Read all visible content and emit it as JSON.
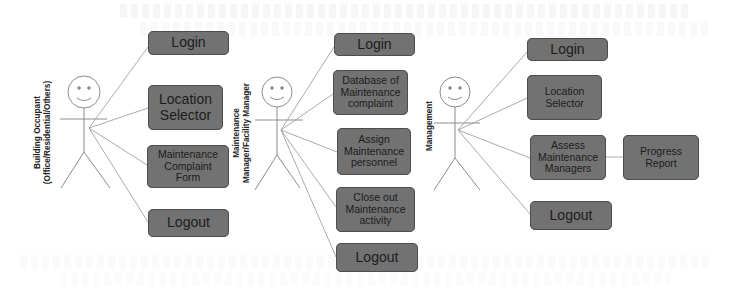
{
  "diagram": {
    "type": "use-case",
    "colors": {
      "background": "#ffffff",
      "box_fill": "#727272",
      "box_border": "#4d4d4d",
      "box_text": "#1c1c1c",
      "line": "#9a9a9a",
      "actor_stroke": "#8c8c8c"
    },
    "actors": [
      {
        "id": "building-occupant",
        "label_line1": "Building Occupant",
        "label_line2": "(Office/Residential/Others)",
        "use_cases": [
          {
            "id": "login",
            "label": "Login"
          },
          {
            "id": "location-selector",
            "label": "Location Selector"
          },
          {
            "id": "maintenance-complaint-form",
            "label": "Maintenance Complaint Form"
          },
          {
            "id": "logout",
            "label": "Logout"
          }
        ]
      },
      {
        "id": "maintenance-manager",
        "label_line1": "Maintenance",
        "label_line2": "Manager/Facility Manager",
        "use_cases": [
          {
            "id": "login",
            "label": "Login"
          },
          {
            "id": "database-of-maintenance-complaint",
            "label": "Database of Maintenance complaint"
          },
          {
            "id": "assign-maintenance-personnel",
            "label": "Assign Maintenance personnel"
          },
          {
            "id": "close-out-maintenance-activity",
            "label": "Close out Maintenance activity"
          },
          {
            "id": "logout",
            "label": "Logout"
          }
        ]
      },
      {
        "id": "management",
        "label_line1": "Management",
        "use_cases": [
          {
            "id": "login",
            "label": "Login"
          },
          {
            "id": "location-selector",
            "label": "Location Selector"
          },
          {
            "id": "assess-maintenance-managers",
            "label": "Assess Maintenance Managers"
          },
          {
            "id": "progress-report",
            "label": "Progress Report"
          },
          {
            "id": "logout",
            "label": "Logout"
          }
        ]
      }
    ],
    "text": {
      "a1": {
        "login": "Login",
        "loc1": "Location",
        "loc2": "Selector",
        "mcf1": "Maintenance",
        "mcf2": "Complaint",
        "mcf3": "Form",
        "logout": "Logout"
      },
      "a2": {
        "login": "Login",
        "db1": "Database of",
        "db2": "Maintenance",
        "db3": "complaint",
        "as1": "Assign",
        "as2": "Maintenance",
        "as3": "personnel",
        "co1": "Close out",
        "co2": "Maintenance",
        "co3": "activity",
        "logout": "Logout"
      },
      "a3": {
        "login": "Login",
        "loc1": "Location",
        "loc2": "Selector",
        "am1": "Assess",
        "am2": "Maintenance",
        "am3": "Managers",
        "pr1": "Progress",
        "pr2": "Report",
        "logout": "Logout"
      }
    }
  }
}
